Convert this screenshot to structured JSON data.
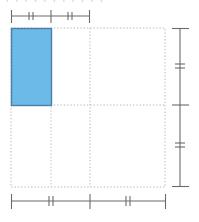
{
  "figure": {
    "background_color": "#ffffff",
    "width": 199,
    "height": 222,
    "clipped_text_top": "ı ı ı ı ı ı ı ı ı ı ı"
  },
  "colors": {
    "shape_fill": "#6CBAE8",
    "shape_stroke": "#4A7FA8",
    "dimension_line": "#6B6B6B",
    "grid_dotted": "#b8b8b8",
    "tick_mark": "#6B6B6B"
  },
  "shape": {
    "name": "highlighted-rectangle",
    "fill": "#6CBAE8",
    "stroke": "#4A7FA8",
    "x": 11,
    "y": 28,
    "width": 40,
    "height": 77
  },
  "grid": {
    "outer": {
      "x": 11,
      "y": 28,
      "width": 154,
      "height": 159
    },
    "vertical_lines": [
      51,
      90,
      165
    ],
    "horizontal_lines": [
      105
    ],
    "style": "dotted"
  },
  "dimensions": {
    "top": {
      "label": "top-dimension-line",
      "y": 16,
      "x_start": 11,
      "x_end": 90,
      "end_tick_height": 13,
      "segments": [
        {
          "from": 11,
          "to": 51,
          "hatch": "double",
          "hatch_at": 31
        },
        {
          "from": 51,
          "to": 90,
          "hatch": "double",
          "hatch_at": 70
        }
      ],
      "divider_ticks": [
        51
      ]
    },
    "bottom": {
      "label": "bottom-dimension-line",
      "y": 201,
      "x_start": 11,
      "x_end": 166,
      "end_tick_height": 15,
      "segments": [
        {
          "from": 11,
          "to": 90,
          "hatch": "double",
          "hatch_at": 51
        },
        {
          "from": 90,
          "to": 166,
          "hatch": "double",
          "hatch_at": 128
        }
      ],
      "divider_ticks": [
        90
      ]
    },
    "right": {
      "label": "right-dimension-line",
      "x": 180,
      "y_start": 28,
      "y_end": 187,
      "end_tick_width": 17,
      "segments": [
        {
          "from": 28,
          "to": 105,
          "hatch": "double",
          "hatch_at": 67
        },
        {
          "from": 105,
          "to": 187,
          "hatch": "double",
          "hatch_at": 146
        }
      ],
      "divider_ticks": [
        105
      ]
    }
  },
  "tick_styles": {
    "double_gap": 4,
    "hatch_length": 9,
    "divider_length": 13
  }
}
